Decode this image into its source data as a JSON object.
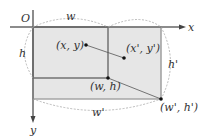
{
  "diagram": {
    "origin_label": "O",
    "x_axis_label": "x",
    "y_axis_label": "y",
    "dimension_labels": {
      "w": "w",
      "h": "h",
      "w_prime": "w'",
      "h_prime": "h'"
    },
    "points": {
      "xy": "(x, y)",
      "xy_prime": "(x', y')",
      "wh": "(w, h)",
      "wh_prime": "(w', h')"
    },
    "colors": {
      "fill": "#e6e6e6",
      "axis": "#666666",
      "inner_stroke": "#555555",
      "outer_stroke": "#9a9a9a",
      "dashed": "#aaaaaa",
      "point": "#111111"
    }
  }
}
